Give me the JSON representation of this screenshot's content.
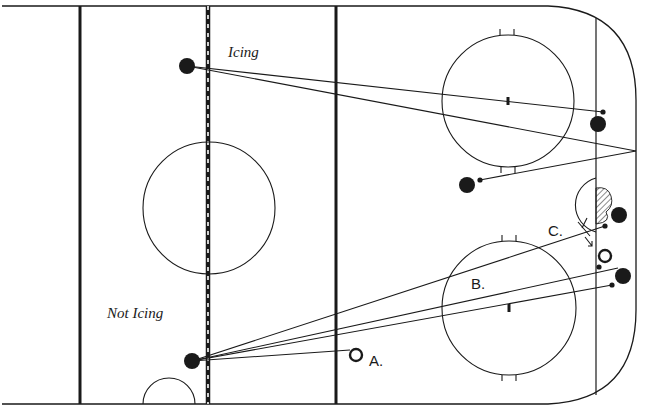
{
  "diagram": {
    "type": "hockey-rink-icing-illustration",
    "colors": {
      "ink": "#1a1a1a",
      "background": "#ffffff"
    },
    "labels": {
      "icing": "Icing",
      "not_icing": "Not Icing",
      "a": "A.",
      "b": "B.",
      "c": "C."
    },
    "rink_lines": [
      {
        "name": "blue-line-left",
        "x": 80
      },
      {
        "name": "center-red-line",
        "x": 208,
        "style": "dashed"
      },
      {
        "name": "blue-line-right",
        "x": 336
      },
      {
        "name": "goal-line",
        "x": 596
      }
    ],
    "circles": [
      {
        "name": "center-faceoff-circle",
        "cx": 209,
        "cy": 208,
        "r": 66
      },
      {
        "name": "top-faceoff-circle",
        "cx": 508,
        "cy": 101,
        "r": 66
      },
      {
        "name": "bottom-faceoff-circle",
        "cx": 509,
        "cy": 308,
        "r": 67
      }
    ],
    "players": [
      {
        "name": "shooter-icing",
        "x": 187,
        "y": 66,
        "filled": true
      },
      {
        "name": "shooter-not-icing",
        "x": 192,
        "y": 361,
        "filled": true
      },
      {
        "name": "defender-top-right",
        "x": 598,
        "y": 124,
        "filled": true
      },
      {
        "name": "defender-mid-left",
        "x": 467,
        "y": 185,
        "filled": true
      },
      {
        "name": "defender-crease",
        "x": 619,
        "y": 215,
        "filled": true
      },
      {
        "name": "defender-bottom-right",
        "x": 623,
        "y": 276,
        "filled": true
      },
      {
        "name": "player-hollow-right",
        "x": 605,
        "y": 256,
        "filled": false
      },
      {
        "name": "player-hollow-a",
        "x": 356,
        "y": 355,
        "filled": false
      }
    ]
  }
}
